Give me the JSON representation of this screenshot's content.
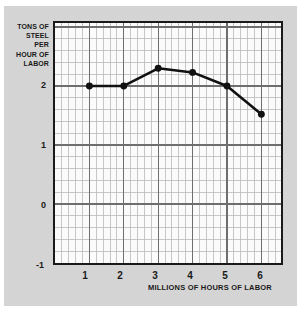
{
  "figure": {
    "background_color": "#d4d4d4",
    "plot_background_color": "#fbfbfb",
    "axis_color": "#1a1a1a",
    "grid_minor_color": "#b9b9b9",
    "grid_major_color": "#6e6e6e",
    "series_color": "#111111"
  },
  "y_axis_caption": {
    "line1": "TONS OF",
    "line2": "STEEL",
    "line3": "PER",
    "line4": "HOUR OF",
    "line5": "LABOR"
  },
  "x_axis_caption": "MILLIONS OF HOURS OF LABOR",
  "ticks": {
    "y": [
      "2",
      "1",
      "0",
      "-1"
    ],
    "x": [
      "1",
      "2",
      "3",
      "4",
      "5",
      "6"
    ]
  },
  "chart_data": {
    "type": "line",
    "title": "",
    "subtitle": "",
    "xlabel": "MILLIONS OF HOURS OF LABOR",
    "ylabel": "TONS OF STEEL PER HOUR OF LABOR",
    "x": [
      1,
      2,
      3,
      4,
      5,
      6
    ],
    "values": [
      2.0,
      2.0,
      2.3,
      2.23,
      2.0,
      1.52
    ],
    "xtick_labels": [
      "1",
      "2",
      "3",
      "4",
      "5",
      "6"
    ],
    "ytick_labels": [
      "2",
      "1",
      "0",
      "-1"
    ],
    "ytick_values": [
      2,
      1,
      0,
      -1
    ],
    "xlim": [
      0.0,
      6.571
    ],
    "ylim": [
      -1,
      3.067
    ],
    "grid": true,
    "grid_minor_step_x": 0.2,
    "grid_minor_step_y": 0.2,
    "grid_major_step_x": 1,
    "grid_major_step_y": 1,
    "legend": "none",
    "markers": "filled-circle",
    "marker_size_px": 7,
    "line_width_px": 2.6
  }
}
